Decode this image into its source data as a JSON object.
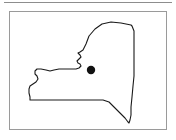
{
  "figure": {
    "panel_label": "New York State outline map",
    "background_color": "#ffffff",
    "frame_color": "#9a9a9a",
    "rule_color": "#8d8d8d",
    "outline_color": "#1a1a1a",
    "marker_color": "#111111"
  },
  "map_data": {
    "type": "outline-map",
    "region": "New York",
    "outline_path": "M 121 13 L 111 11 L 101 10 L 92 12 L 85 17 L 79 24 L 76 32 L 73 38 L 70 40 L 68 41 L 70 43 L 71 45 L 69 47 L 67 49 L 68 51 L 70 52 L 71 54 L 69 56 L 66 57 L 61 57 L 55 57 L 49 57 L 44 58 L 40 59 L 36 58 L 31 57 L 27 57 L 25 59 L 25 62 L 27 64 L 28 67 L 26 70 L 23 72 L 20 74 L 19 77 L 19 81 L 20 85 L 20 88 L 29 88 L 45 88 L 65 88 L 82 88 L 93 88 L 99 90 L 104 95 L 110 101 L 115 106 L 118 110 L 119 111 L 120 108 L 121 103 L 121 95 L 122 85 L 123 74 L 124 64 L 124 52 L 124 40 L 124 28 L 124 19 L 122 14 Z",
    "marker": {
      "label": "location-marker",
      "x": 81,
      "y": 58,
      "radius": 4.2
    },
    "viewbox": {
      "width": 158,
      "height": 119
    }
  }
}
